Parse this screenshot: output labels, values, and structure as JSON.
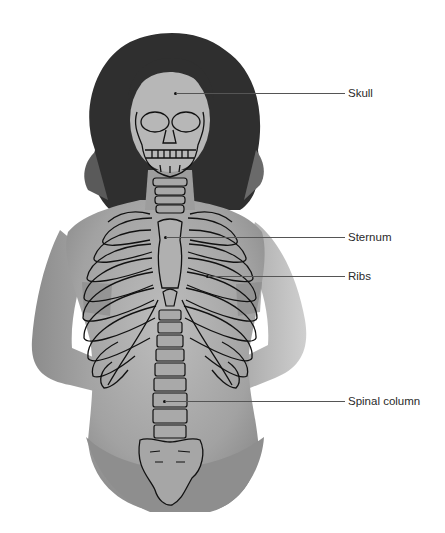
{
  "figure": {
    "labels": [
      {
        "id": "skull",
        "text": "Skull",
        "y": 93,
        "line_x1": 175,
        "line_x2": 345,
        "text_x": 348
      },
      {
        "id": "sternum",
        "text": "Sternum",
        "y": 237,
        "line_x1": 166,
        "line_x2": 345,
        "text_x": 348
      },
      {
        "id": "ribs",
        "text": "Ribs",
        "y": 276,
        "line_x1": 208,
        "line_x2": 345,
        "text_x": 348
      },
      {
        "id": "spinal-column",
        "text": "Spinal column",
        "y": 401,
        "line_x1": 165,
        "line_x2": 345,
        "text_x": 348
      }
    ],
    "colors": {
      "background": "#ffffff",
      "skin": "#a9a9a9",
      "hair": "#2b2b2b",
      "outline": "#111111",
      "garment": "#8e8e8e",
      "label_text": "#2a2a2a",
      "leader_line": "#555555"
    }
  }
}
